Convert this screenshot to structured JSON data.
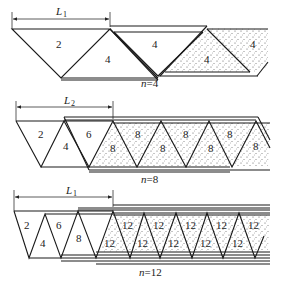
{
  "panels": [
    {
      "id": "n4",
      "dimension_label": "L",
      "dimension_sub": "1",
      "caption": "n=4",
      "caption_var": "n",
      "caption_val": "=4",
      "triangle_labels": [
        "2",
        "4",
        "4",
        "4",
        "4"
      ]
    },
    {
      "id": "n8",
      "dimension_label": "L",
      "dimension_sub": "2",
      "caption": "n=8",
      "caption_var": "n",
      "caption_val": "=8",
      "triangle_labels": [
        "2",
        "4",
        "6",
        "8",
        "8",
        "8",
        "8",
        "8",
        "8",
        "8"
      ]
    },
    {
      "id": "n12",
      "dimension_label": "L",
      "dimension_sub": "1",
      "caption": "n=12",
      "caption_var": "n",
      "caption_val": "=12",
      "triangle_labels": [
        "2",
        "4",
        "6",
        "8",
        "12",
        "12",
        "12",
        "12",
        "12",
        "12",
        "12",
        "12",
        "12",
        "12"
      ]
    }
  ],
  "colors": {
    "line": "#1a1a1a",
    "stipple": "#555555",
    "background": "#ffffff"
  }
}
